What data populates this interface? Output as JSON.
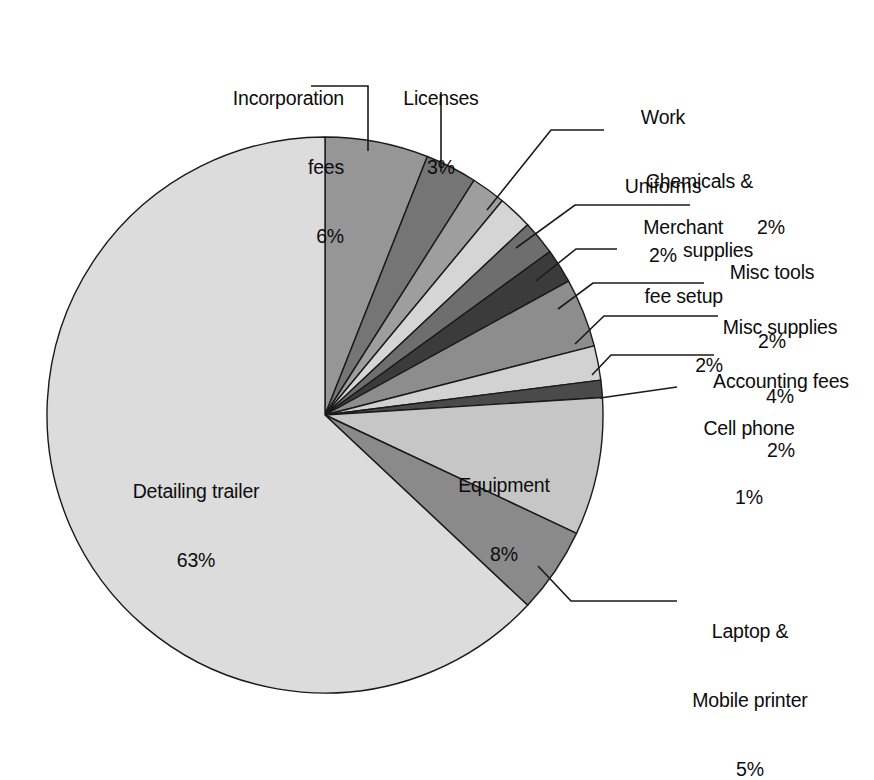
{
  "chart_data": {
    "type": "pie",
    "title": "",
    "subtitle": "",
    "xlabel": "",
    "ylabel": "",
    "units": "percent",
    "legend_position": "none",
    "grid": false,
    "label_style": "callout-with-leader-lines",
    "start_angle_deg": 0,
    "direction": "clockwise",
    "total": 100,
    "categories": [
      "Incorporation fees",
      "Licenses",
      "Work Uniforms",
      "Chemicals & supplies",
      "Merchant fee setup",
      "Misc tools",
      "Misc supplies",
      "Accounting fees",
      "Cell phone",
      "Equipment",
      "Laptop & Mobile printer",
      "Detailing trailer"
    ],
    "values": [
      6,
      3,
      2,
      2,
      2,
      2,
      4,
      2,
      1,
      8,
      5,
      63
    ],
    "colors": [
      "#969696",
      "#757575",
      "#9e9e9e",
      "#d5d5d5",
      "#6e6e6e",
      "#3b3b3b",
      "#8d8d8d",
      "#d2d2d2",
      "#4a4a4a",
      "#c6c6c6",
      "#8a8a8a",
      "#dcdcdc"
    ],
    "slice_outline_color": "#1a1a1a",
    "background_color": "#ffffff"
  },
  "labels": {
    "incorporation_fees": {
      "line1": "Incorporation",
      "line2": "fees",
      "line3": "6%"
    },
    "licenses": {
      "line1": "Licenses",
      "line2": "3%"
    },
    "work_uniforms": {
      "line1": "Work",
      "line2": "Uniforms",
      "line3": "2%"
    },
    "chemicals_supplies": {
      "line1": "Chemicals &",
      "line2": "supplies",
      "line3": "2%"
    },
    "merchant_fee_setup": {
      "line1": "Merchant",
      "line2": "fee setup",
      "line3": "2%"
    },
    "misc_tools": {
      "line1": "Misc tools",
      "line2": "2%"
    },
    "misc_supplies": {
      "line1": "Misc supplies",
      "line2": "4%"
    },
    "accounting_fees": {
      "line1": "Accounting fees",
      "line2": "2%"
    },
    "cell_phone": {
      "line1": "Cell phone",
      "line2": "1%"
    },
    "equipment": {
      "line1": "Equipment",
      "line2": "8%"
    },
    "laptop_mobile_printer": {
      "line1": "Laptop &",
      "line2": "Mobile printer",
      "line3": "5%"
    },
    "detailing_trailer": {
      "line1": "Detailing trailer",
      "line2": "63%"
    }
  }
}
